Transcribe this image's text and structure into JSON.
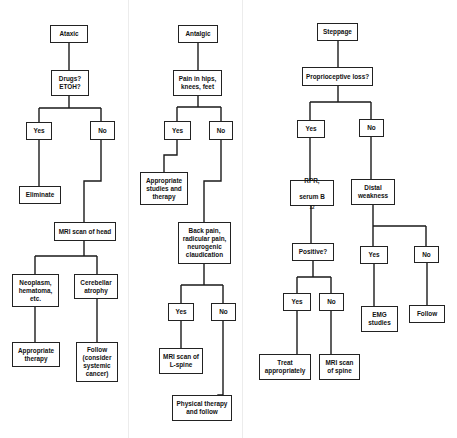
{
  "panels": [
    {
      "name": "ataxic",
      "nodes": {
        "root": "Ataxic",
        "q1": "Drugs? ETOH?",
        "yes1": "Yes",
        "no1": "No",
        "eliminate": "Eliminate",
        "mri_head": "MRI scan of head",
        "neoplasm": "Neoplasm, hematoma, etc.",
        "cerebellar": "Cerebellar atrophy",
        "approp_therapy": "Appropriate therapy",
        "follow": "Follow (consider systemic cancer)"
      }
    },
    {
      "name": "antalgic",
      "nodes": {
        "root": "Antalgic",
        "q1": "Pain in hips, knees, feet",
        "yes1": "Yes",
        "no1": "No",
        "approp_studies": "Appropriate studies and therapy",
        "back_pain": "Back pain, radicular pain, neurogenic claudication",
        "yes2": "Yes",
        "no2": "No",
        "mri_lspine": "MRI scan of L-spine",
        "physical_therapy": "Physical therapy and follow"
      }
    },
    {
      "name": "steppage",
      "nodes": {
        "root": "Steppage",
        "q1": "Proprioceptive loss?",
        "yes1": "Yes",
        "no1": "No",
        "rpr_line1": "RPR,",
        "rpr_line2": "serum B",
        "rpr_sub": "12",
        "distal": "Distal weakness",
        "positive": "Positive?",
        "yes2": "Yes",
        "no2": "No",
        "yes3": "Yes",
        "no3": "No",
        "emg": "EMG studies",
        "follow": "Follow",
        "treat": "Treat appropriately",
        "mri_spine": "MRI scan of spine"
      }
    }
  ]
}
